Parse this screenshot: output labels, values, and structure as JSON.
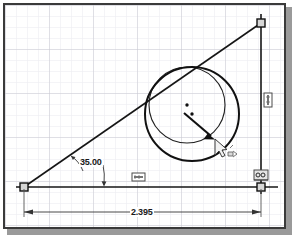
{
  "app": {
    "title": "Sketch Graphics Window",
    "mode": "2D Sketch - dragging circle"
  },
  "canvas": {
    "background_color": "#ffffff",
    "border_color": "#3a3a3a",
    "shadow_color": "#9a9a9a",
    "grid": {
      "minor_color": "#e9e9ee",
      "major_color": "#c9c9d2",
      "minor_spacing_px": 11,
      "major_every": 4
    }
  },
  "geometry": {
    "line_color": "#161616",
    "vertices": [
      {
        "name": "bottom-left-vertex",
        "x": 22,
        "y": 185,
        "marker": "square"
      },
      {
        "name": "top-right-vertex",
        "x": 259,
        "y": 21,
        "marker": "square"
      },
      {
        "name": "bottom-right-vertex",
        "x": 259,
        "y": 185,
        "marker": "square"
      }
    ],
    "lines": [
      {
        "name": "inclined-line",
        "x1": 22,
        "y1": 185,
        "x2": 259,
        "y2": 21
      },
      {
        "name": "horizontal-line",
        "x1": 14,
        "y1": 185,
        "x2": 276,
        "y2": 185
      },
      {
        "name": "vertical-line",
        "x1": 259,
        "y1": 12,
        "x2": 259,
        "y2": 192
      }
    ],
    "circles": [
      {
        "name": "original-circle",
        "cx": 185,
        "cy": 103,
        "r": 38,
        "stroke_width": 1.1,
        "center_dot": true
      },
      {
        "name": "dragged-circle",
        "cx": 190,
        "cy": 112,
        "r": 47,
        "stroke_width": 1.9,
        "center_dot": true
      }
    ]
  },
  "dimensions": {
    "angle": {
      "name": "angle-dimension",
      "value": "35.00",
      "text_x": 78,
      "text_y": 155
    },
    "linear": {
      "name": "horizontal-dimension",
      "value": "2.395",
      "text_x": 129,
      "text_y": 208
    }
  },
  "constraints": [
    {
      "name": "horizontal-constraint-symbol",
      "x": 130,
      "y": 171,
      "type": "horizontal"
    },
    {
      "name": "vertical-constraint-symbol",
      "x": 263,
      "y": 95,
      "type": "vertical"
    },
    {
      "name": "coincident-constraint-symbol",
      "x": 253,
      "y": 170,
      "type": "coincident"
    }
  ],
  "cursor": {
    "name": "drag-cursor",
    "x": 213,
    "y": 137,
    "label": "drag-move-pointer"
  },
  "drag_arrow": {
    "name": "drag-direction-arrow",
    "x1": 182,
    "y1": 111,
    "x2": 213,
    "y2": 137
  }
}
